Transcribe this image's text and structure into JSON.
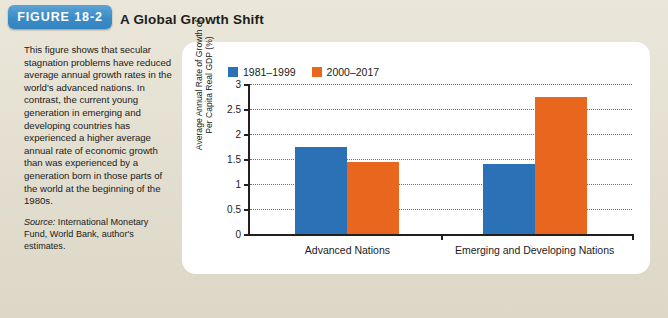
{
  "figure": {
    "badge": "FIGURE 18-2",
    "title": "A Global Growth Shift",
    "caption": "This figure shows that secular stagnation problems have reduced average annual growth rates in the world's advanced nations. In contrast, the current young generation in emerging and developing countries has experienced a higher average annual rate of economic growth than was experienced by a generation born in those parts of the world at the beginning of the 1980s.",
    "source_label": "Source:",
    "source_text": " International Monetary Fund, World Bank, author's estimates."
  },
  "colors": {
    "series1": "#2a72b5",
    "series2": "#e8661e",
    "badge": "#3a8cc6",
    "page_background": "#e3decd",
    "panel": "#ffffff",
    "axis": "#231f20"
  },
  "chart_data": {
    "type": "bar",
    "title": "A Global Growth Shift",
    "xlabel": "",
    "ylabel": "Average Annual Rate of Growth of Per Capita Real GDP (%)",
    "ylabel_line1": "Average Annual Rate of Growth of",
    "ylabel_line2": "Per Capita Real GDP (%)",
    "categories": [
      "Advanced Nations",
      "Emerging and Developing Nations"
    ],
    "series": [
      {
        "name": "1981–1999",
        "color": "#2a72b5",
        "values": [
          1.75,
          1.4
        ]
      },
      {
        "name": "2000–2017",
        "color": "#e8661e",
        "values": [
          1.45,
          2.75
        ]
      }
    ],
    "ylim": [
      0,
      3
    ],
    "yticks": [
      0,
      0.5,
      1,
      1.5,
      2,
      2.5,
      3
    ],
    "ytick_labels": [
      "0",
      "0.5",
      "1",
      "1.5",
      "2",
      "2.5",
      "3"
    ],
    "grid": true,
    "legend_position": "top-left"
  }
}
